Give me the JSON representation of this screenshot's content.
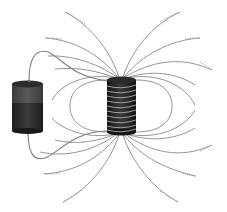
{
  "diagram": {
    "description": "Battery connected by wires to a solenoid coil, with magnetic field lines around the coil",
    "components": [
      {
        "name": "battery",
        "label": ""
      },
      {
        "name": "solenoid-coil",
        "label": "",
        "windings": 10
      },
      {
        "name": "connecting-wires",
        "label": ""
      },
      {
        "name": "magnetic-field-lines",
        "label": ""
      }
    ],
    "colors": {
      "background": "#ffffff",
      "battery_top": "#4a4a4a",
      "battery_bottom": "#2a2a2a",
      "coil_body": "#1e1e1e",
      "coil_winding": "#bdbdbd",
      "field_line": "#8a8a8a"
    }
  }
}
